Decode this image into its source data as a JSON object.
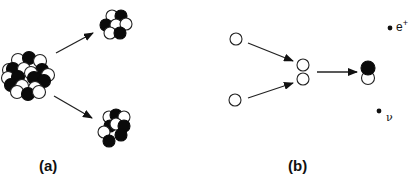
{
  "figure": {
    "panels": [
      {
        "id": "a",
        "label": "(a)",
        "description": "Nuclear fission: heavy nucleus splits into two smaller nuclei",
        "parent_nucleus": {
          "protons": "white",
          "neutrons": "black"
        },
        "fragments": 2
      },
      {
        "id": "b",
        "label": "(b)",
        "description": "Proton-proton fusion: two protons form a deuteron emitting positron and neutrino",
        "products": {
          "positron_label": "e",
          "positron_superscript": "+",
          "neutrino_label": "ν"
        }
      }
    ],
    "colors": {
      "proton": "#ffffff",
      "neutron": "#0a0a0a",
      "stroke": "#222222",
      "background": "#ffffff"
    }
  }
}
